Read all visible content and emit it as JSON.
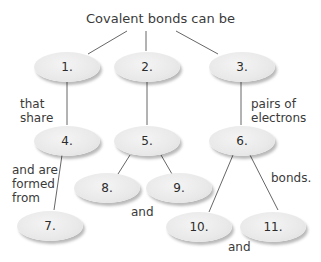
{
  "title": "Covalent bonds can be",
  "nodes": [
    {
      "id": "1",
      "label": "1."
    },
    {
      "id": "2",
      "label": "2."
    },
    {
      "id": "3",
      "label": "3."
    },
    {
      "id": "4",
      "label": "4."
    },
    {
      "id": "5",
      "label": "5."
    },
    {
      "id": "6",
      "label": "6."
    },
    {
      "id": "7",
      "label": "7."
    },
    {
      "id": "8",
      "label": "8."
    },
    {
      "id": "9",
      "label": "9."
    },
    {
      "id": "10",
      "label": "10."
    },
    {
      "id": "11",
      "label": "11."
    }
  ],
  "link_labels": {
    "that_share": "that share",
    "pairs_of_electrons": "pairs of electrons",
    "and_are_formed_from": "and are formed from",
    "bonds": "bonds.",
    "and_8_9": "and",
    "and_10_11": "and"
  },
  "colors": {
    "node_fill": "#e9e9e9",
    "line": "#555555",
    "text": "#333333"
  }
}
